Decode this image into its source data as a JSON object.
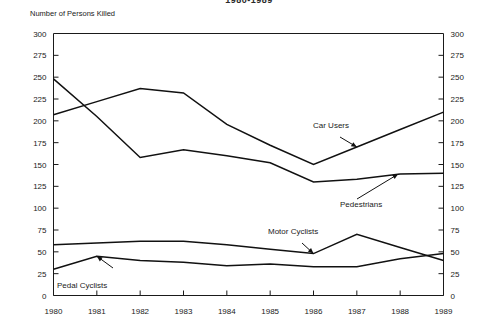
{
  "chart_data": {
    "type": "line",
    "title": "1980-1989",
    "ylabel": "Number of Persons Killed",
    "xlabel": "",
    "x": [
      1980,
      1981,
      1982,
      1983,
      1984,
      1985,
      1986,
      1987,
      1988,
      1989
    ],
    "xtick_labels": [
      "1980",
      "1981",
      "1982",
      "1983",
      "1984",
      "1985",
      "1986",
      "1987",
      "1988",
      "1989"
    ],
    "ytick_labels": [
      "0",
      "25",
      "50",
      "75",
      "100",
      "125",
      "150",
      "175",
      "200",
      "225",
      "250",
      "275",
      "300"
    ],
    "ytick_values": [
      0,
      25,
      50,
      75,
      100,
      125,
      150,
      175,
      200,
      225,
      250,
      275,
      300
    ],
    "ylim": [
      0,
      300
    ],
    "xlim": [
      1980,
      1989
    ],
    "grid": false,
    "legend_position": "inline-annotations",
    "dual_y_axis": true,
    "series": [
      {
        "name": "Car Users",
        "values": [
          207,
          222,
          237,
          232,
          196,
          172,
          150,
          170,
          190,
          210
        ]
      },
      {
        "name": "Pedestrians",
        "values": [
          248,
          205,
          158,
          167,
          160,
          152,
          130,
          133,
          139,
          140
        ]
      },
      {
        "name": "Motor Cyclists",
        "values": [
          58,
          60,
          62,
          62,
          58,
          53,
          48,
          70,
          55,
          40
        ]
      },
      {
        "name": "Pedal Cyclists",
        "values": [
          30,
          45,
          40,
          38,
          34,
          36,
          33,
          33,
          42,
          48
        ]
      }
    ],
    "annotations": [
      {
        "text": "Car Users",
        "series": "Car Users"
      },
      {
        "text": "Pedestrians",
        "series": "Pedestrians"
      },
      {
        "text": "Motor Cyclists",
        "series": "Motor Cyclists"
      },
      {
        "text": "Pedal Cyclists",
        "series": "Pedal Cyclists"
      }
    ]
  }
}
